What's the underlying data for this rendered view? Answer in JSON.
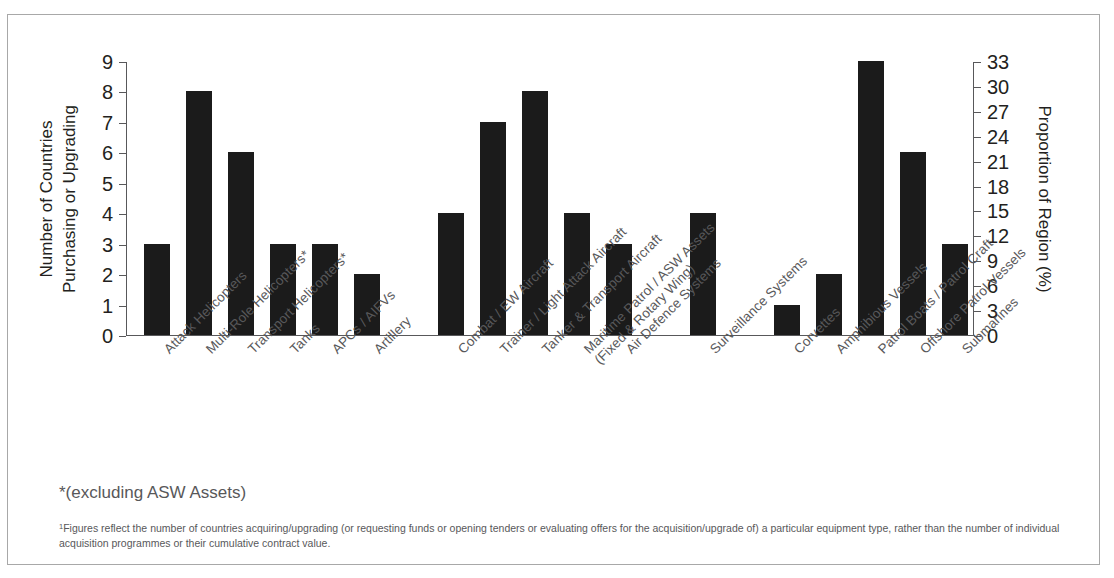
{
  "chart_data": {
    "type": "bar",
    "title": "",
    "ylabel": "Number of Countries Purchasing or Upgrading",
    "ylabel_line1": "Number of Countries",
    "ylabel_line2": "Purchasing or Upgrading",
    "ylabel_right": "Proportion of Region (%)",
    "xlabel": "",
    "ylim": [
      0,
      9
    ],
    "yticks": [
      "0",
      "1",
      "2",
      "3",
      "4",
      "5",
      "6",
      "7",
      "8",
      "9"
    ],
    "ylim_right": [
      0,
      33
    ],
    "yticks_right": [
      "0",
      "3",
      "6",
      "9",
      "12",
      "15",
      "18",
      "21",
      "24",
      "27",
      "30",
      "33"
    ],
    "grid": false,
    "legend": "none",
    "bar_color": "#1b1b1b",
    "categories": [
      "Attack Helicopters",
      "Multi-Role Helicopters*",
      "Transport Helicopters*",
      "Tanks",
      "APCs / AIFVs",
      "Artillery",
      "Combat / EW Aircraft",
      "Trainer / Light Attack Aircraft",
      "Tanker & Transport Aircraft",
      "Maritime Patrol / ASW Assets (Fixed & Rotary Wing)",
      "Air Defence Systems",
      "Surveillance Systems",
      "Corvettes",
      "Amphibious Vessels",
      "Patrol Boats / Patrol Craft",
      "Offshore Patrol Vessels",
      "Submarines"
    ],
    "values": [
      3,
      8,
      6,
      3,
      3,
      2,
      4,
      7,
      8,
      4,
      3,
      4,
      1,
      2,
      9,
      6,
      3
    ],
    "bars": [
      {
        "label": "Attack Helicopters",
        "label_line1": "Attack Helicopters",
        "label_line2": "",
        "value": 3,
        "slot": 0
      },
      {
        "label": "Multi-Role Helicopters*",
        "label_line1": "Multi-Role Helicopters*",
        "label_line2": "",
        "value": 8,
        "slot": 1
      },
      {
        "label": "Transport Helicopters*",
        "label_line1": "Transport Helicopters*",
        "label_line2": "",
        "value": 6,
        "slot": 2
      },
      {
        "label": "Tanks",
        "label_line1": "Tanks",
        "label_line2": "",
        "value": 3,
        "slot": 3
      },
      {
        "label": "APCs / AIFVs",
        "label_line1": "APCs / AIFVs",
        "label_line2": "",
        "value": 3,
        "slot": 4
      },
      {
        "label": "Artillery",
        "label_line1": "Artillery",
        "label_line2": "",
        "value": 2,
        "slot": 5
      },
      {
        "label": "Combat / EW Aircraft",
        "label_line1": "Combat / EW Aircraft",
        "label_line2": "",
        "value": 4,
        "slot": 7
      },
      {
        "label": "Trainer / Light Attack Aircraft",
        "label_line1": "Trainer / Light Attack Aircraft",
        "label_line2": "",
        "value": 7,
        "slot": 8
      },
      {
        "label": "Tanker & Transport Aircraft",
        "label_line1": "Tanker & Transport Aircraft",
        "label_line2": "",
        "value": 8,
        "slot": 9
      },
      {
        "label": "Maritime Patrol / ASW Assets (Fixed & Rotary Wing)",
        "label_line1": "Maritime Patrol / ASW Assets",
        "label_line2": "(Fixed & Rotary Wing)",
        "value": 4,
        "slot": 10
      },
      {
        "label": "Air Defence Systems",
        "label_line1": "Air Defence Systems",
        "label_line2": "",
        "value": 3,
        "slot": 11
      },
      {
        "label": "Surveillance Systems",
        "label_line1": "Surveillance Systems",
        "label_line2": "",
        "value": 4,
        "slot": 13
      },
      {
        "label": "Corvettes",
        "label_line1": "Corvettes",
        "label_line2": "",
        "value": 1,
        "slot": 15
      },
      {
        "label": "Amphibious Vessels",
        "label_line1": "Amphibious Vessels",
        "label_line2": "",
        "value": 2,
        "slot": 16
      },
      {
        "label": "Patrol Boats / Patrol Craft",
        "label_line1": "Patrol Boats / Patrol Craft",
        "label_line2": "",
        "value": 9,
        "slot": 17
      },
      {
        "label": "Offshore Patrol Vessels",
        "label_line1": "Offshore Patrol Vessels",
        "label_line2": "",
        "value": 6,
        "slot": 18
      },
      {
        "label": "Submarines",
        "label_line1": "Submarines",
        "label_line2": "",
        "value": 3,
        "slot": 19
      }
    ]
  },
  "notes": {
    "asterisk": "*(excluding ASW Assets)",
    "footnote_marker": "1",
    "footnote": "Figures reflect the number of countries acquiring/upgrading (or requesting funds or opening tenders or evaluating offers for the acquisition/upgrade of) a particular equipment type, rather than the number of individual acquisition programmes or their cumulative contract value."
  }
}
